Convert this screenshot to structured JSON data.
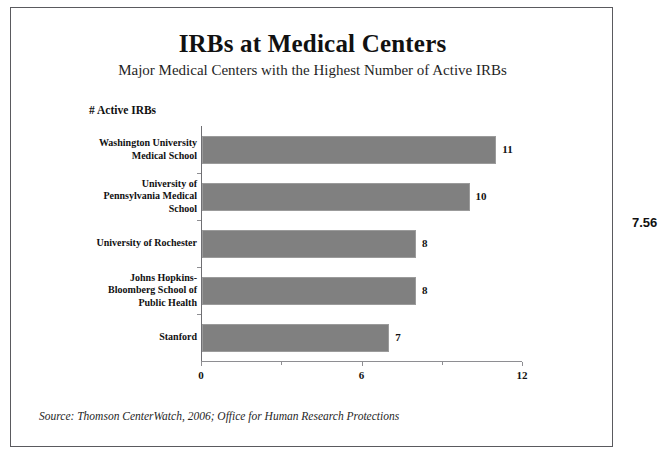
{
  "chart_data": {
    "type": "bar",
    "orientation": "horizontal",
    "title": "IRBs at Medical Centers",
    "subtitle": "Major Medical Centers with the Highest Number of Active IRBs",
    "value_axis_caption": "# Active IRBs",
    "xlabel": "",
    "ylabel": "",
    "categories": [
      "Washington University Medical School",
      "University of Pennsylvania Medical School",
      "University of Rochester",
      "Johns Hopkins-Bloomberg School of Public Health",
      "Stanford"
    ],
    "category_lines": [
      [
        "Washington University",
        "Medical School"
      ],
      [
        "University of",
        "Pennsylvania Medical",
        "School"
      ],
      [
        "University of Rochester"
      ],
      [
        "Johns Hopkins-",
        "Bloomberg School of",
        "Public Health"
      ],
      [
        "Stanford"
      ]
    ],
    "values": [
      11,
      10,
      8,
      8,
      7
    ],
    "value_labels": [
      "11",
      "10",
      "8",
      "8",
      "7"
    ],
    "xlim": [
      0,
      12
    ],
    "xticks": [
      0,
      6,
      12
    ],
    "xtick_labels": [
      "0",
      "6",
      "12"
    ],
    "minor_xticks": [
      3,
      9
    ],
    "grid": false,
    "legend": false,
    "bar_color": "#808080",
    "bar_border_color": "#9b9b9b",
    "axis_color": "#8e8e92"
  },
  "source_note": "Source: Thomson CenterWatch, 2006; Office for Human Research Protections",
  "margin_annotation": "7.56"
}
